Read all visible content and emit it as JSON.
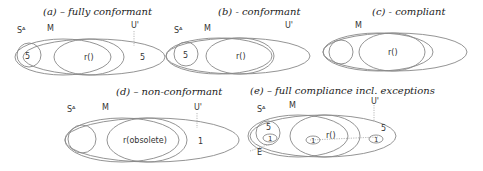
{
  "panels": [
    {
      "id": "a",
      "title": "(a) – fully conformant",
      "labels": {
        "sa": "Sᴬ",
        "m": "M",
        "u": "U'",
        "r": "r()",
        "sa_count": "5",
        "u_count": "5"
      },
      "regions": {
        "m_minus_r": "diagonal-hatch",
        "u_minus_m": "none",
        "sa": "white"
      }
    },
    {
      "id": "b",
      "title": "(b) - conformant",
      "labels": {
        "sa": "Sᴬ",
        "m": "M",
        "u": "U'",
        "r": "r()",
        "sa_count": "5"
      },
      "regions": {
        "m_minus_r": "diagonal-hatch",
        "u_minus_m": "vertical-hatch",
        "sa": "white"
      }
    },
    {
      "id": "c",
      "title": "(c) - compliant",
      "labels": {
        "m": "M",
        "r": "r()"
      },
      "regions": {
        "m_minus_r": "diagonal-hatch",
        "u_minus_m": "vertical-hatch",
        "sa": "diagonal-hatch"
      }
    },
    {
      "id": "d",
      "title": "(d) – non-conformant",
      "labels": {
        "sa": "Sᴬ",
        "m": "M",
        "u": "U'",
        "r": "r(obsolete)",
        "u_count": "1"
      },
      "regions": {
        "m_minus_r": "diagonal-hatch",
        "u_minus_m": "none",
        "sa": "diagonal-hatch"
      }
    },
    {
      "id": "e",
      "title": "(e) – full compliance incl. exceptions",
      "labels": {
        "sa": "Sᴬ",
        "m": "M",
        "u": "U'",
        "r": "r()",
        "e": "E",
        "sa_count": "5",
        "u_count": "5",
        "exception_count": "1"
      },
      "regions": {
        "m_minus_r": "diagonal-hatch",
        "u_minus_m": "none",
        "sa": "white"
      }
    }
  ]
}
